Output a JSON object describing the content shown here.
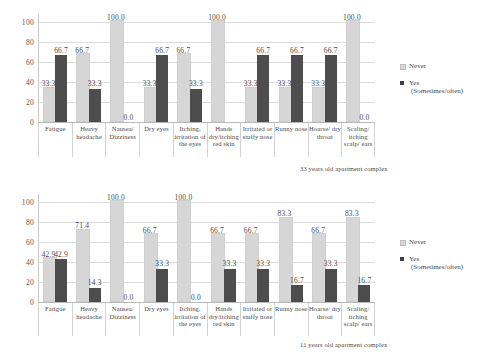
{
  "legend": {
    "never_label": "Never",
    "yes_label": "Yes",
    "yes_sub_label": "(Sometimes/often)"
  },
  "axis": {
    "unit": "%",
    "ticks": [
      "100",
      "80",
      "60",
      "40",
      "20",
      "0"
    ]
  },
  "chart_data": [
    {
      "type": "bar",
      "title": "33 years old apartment complex",
      "xlabel": "",
      "ylabel": "%",
      "ylim": [
        0,
        100
      ],
      "grid": true,
      "legend_position": "right",
      "categories": [
        "Fatigue",
        "Heavy headache",
        "Nausea/ Dizziness",
        "Dry eyes",
        "Itching, irritation of the eyes",
        "Hands dry/itching red skin",
        "Irritated or stuffy nose",
        "Runny nose",
        "Hoarse/ dry throat",
        "Scaling/ itching scalp/ ears"
      ],
      "series": [
        {
          "name": "Never",
          "values": [
            33.3,
            66.7,
            100.0,
            33.3,
            66.7,
            100.0,
            33.3,
            33.3,
            33.3,
            100.0
          ]
        },
        {
          "name": "Yes (Sometimes/often)",
          "values": [
            66.7,
            33.3,
            0.0,
            66.7,
            33.3,
            0.0,
            66.7,
            66.7,
            66.7,
            0.0
          ]
        }
      ],
      "labels": {
        "never": [
          "33.3",
          "66.7",
          "100.0",
          "33.3",
          "66.7",
          "100.0",
          "33.3",
          "33.3",
          "33.3",
          "100.0"
        ],
        "yes": [
          "66.7",
          "33.3",
          "0.0",
          "66.7",
          "33.3",
          "",
          "66.7",
          "66.7",
          "66.7",
          "0.0"
        ]
      }
    },
    {
      "type": "bar",
      "title": "11 years old apartment complex",
      "xlabel": "",
      "ylabel": "%",
      "ylim": [
        0,
        100
      ],
      "grid": true,
      "legend_position": "right",
      "categories": [
        "Fatigue",
        "Heavy headache",
        "Nausea/ Dizziness",
        "Dry eyes",
        "Itching, irritation of the eyes",
        "Hands dry/itching red skin",
        "Irritated or stuffy nose",
        "Runny nose",
        "Hoarse/ dry throat",
        "Scaling/ itching scalp/ ears"
      ],
      "series": [
        {
          "name": "Never",
          "values": [
            42.9,
            71.4,
            100.0,
            66.7,
            100.0,
            66.7,
            66.7,
            83.3,
            66.7,
            83.3
          ]
        },
        {
          "name": "Yes (Sometimes/often)",
          "values": [
            42.9,
            14.3,
            0.0,
            33.3,
            0.0,
            33.3,
            33.3,
            16.7,
            33.3,
            16.7
          ]
        }
      ],
      "labels": {
        "never": [
          "42.9",
          "71.4",
          "100.0",
          "66.7",
          "100.0",
          "66.7",
          "66.7",
          "83.3",
          "66.7",
          "83.3"
        ],
        "yes": [
          "42.9",
          "14.3",
          "0.0",
          "33.3",
          "0.0",
          "33.3",
          "33.3",
          "16.7",
          "33.3",
          "16.7"
        ]
      }
    }
  ]
}
